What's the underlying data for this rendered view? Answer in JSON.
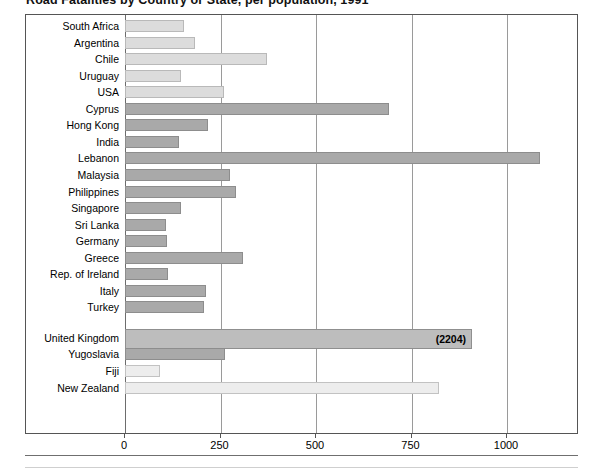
{
  "chart_data": {
    "type": "bar",
    "orientation": "horizontal",
    "title": "Road Fatalities by Country or State, per population, 1991",
    "xlabel": "",
    "ylabel": "",
    "xlim": [
      0,
      1200
    ],
    "grid": true,
    "legend": null,
    "ticks": [
      {
        "label": "0",
        "value": 0
      },
      {
        "label": "250",
        "value": 250
      },
      {
        "label": "500",
        "value": 500
      },
      {
        "label": "750",
        "value": 750
      },
      {
        "label": "1000",
        "value": 1000
      }
    ],
    "categories": [
      "South Africa",
      "Argentina",
      "Chile",
      "Uruguay",
      "USA",
      "Cyprus",
      "Hong Kong",
      "India",
      "Lebanon",
      "Malaysia",
      "Philippines",
      "Singapore",
      "Sri Lanka",
      "Germany",
      "Greece",
      "Rep. of Ireland",
      "Italy",
      "Turkey",
      "United Kingdom",
      "Yugoslavia",
      "Fiji",
      "New Zealand"
    ],
    "values": [
      154,
      183,
      373,
      147,
      258,
      690,
      218,
      142,
      1086,
      276,
      291,
      147,
      107,
      109,
      308,
      112,
      212,
      208,
      2204,
      263,
      92,
      823
    ],
    "bars": [
      {
        "label": "South Africa",
        "value": 154,
        "shade": "light",
        "truncated": false,
        "value_label": ""
      },
      {
        "label": "Argentina",
        "value": 183,
        "shade": "light",
        "truncated": false,
        "value_label": ""
      },
      {
        "label": "Chile",
        "value": 373,
        "shade": "light",
        "truncated": false,
        "value_label": ""
      },
      {
        "label": "Uruguay",
        "value": 147,
        "shade": "light",
        "truncated": false,
        "value_label": ""
      },
      {
        "label": "USA",
        "value": 258,
        "shade": "light",
        "truncated": false,
        "value_label": ""
      },
      {
        "label": "Cyprus",
        "value": 690,
        "shade": "dark",
        "truncated": false,
        "value_label": ""
      },
      {
        "label": "Hong Kong",
        "value": 218,
        "shade": "dark",
        "truncated": false,
        "value_label": ""
      },
      {
        "label": "India",
        "value": 142,
        "shade": "dark",
        "truncated": false,
        "value_label": ""
      },
      {
        "label": "Lebanon",
        "value": 1086,
        "shade": "dark",
        "truncated": false,
        "value_label": ""
      },
      {
        "label": "Malaysia",
        "value": 276,
        "shade": "dark",
        "truncated": false,
        "value_label": ""
      },
      {
        "label": "Philippines",
        "value": 291,
        "shade": "dark",
        "truncated": false,
        "value_label": ""
      },
      {
        "label": "Singapore",
        "value": 147,
        "shade": "dark",
        "truncated": false,
        "value_label": ""
      },
      {
        "label": "Sri Lanka",
        "value": 107,
        "shade": "dark",
        "truncated": false,
        "value_label": ""
      },
      {
        "label": "Germany",
        "value": 109,
        "shade": "dark",
        "truncated": false,
        "value_label": ""
      },
      {
        "label": "Greece",
        "value": 308,
        "shade": "dark",
        "truncated": false,
        "value_label": ""
      },
      {
        "label": "Rep. of Ireland",
        "value": 112,
        "shade": "dark",
        "truncated": false,
        "value_label": ""
      },
      {
        "label": "Italy",
        "value": 212,
        "shade": "dark",
        "truncated": false,
        "value_label": ""
      },
      {
        "label": "Turkey",
        "value": 208,
        "shade": "dark",
        "truncated": false,
        "value_label": ""
      },
      {
        "label": "United Kingdom",
        "value": 2204,
        "shade": "truncated",
        "truncated": true,
        "value_label": "(2204)"
      },
      {
        "label": "Yugoslavia",
        "value": 263,
        "shade": "dark",
        "truncated": false,
        "value_label": ""
      },
      {
        "label": "Fiji",
        "value": 92,
        "shade": "pale",
        "truncated": false,
        "value_label": ""
      },
      {
        "label": "New Zealand",
        "value": 823,
        "shade": "pale",
        "truncated": false,
        "value_label": ""
      }
    ]
  },
  "colors": {
    "frame": "#555555",
    "gridline": "#9a9a9a",
    "bar_light": "#dcdcdc",
    "bar_dark": "#a9a9a9",
    "bar_pale": "#ededed",
    "text": "#000000",
    "background": "#ffffff"
  }
}
